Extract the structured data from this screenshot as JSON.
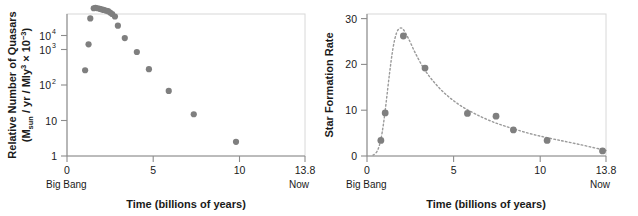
{
  "figure": {
    "panels": [
      {
        "id": "quasars",
        "ylabel_line1": "Relative Number of Quasars",
        "ylabel_line2_a": "(M",
        "ylabel_line2_sub": "sun",
        "ylabel_line2_b": " / yr / Mly",
        "ylabel_line2_sup1": "3",
        "ylabel_line2_c": " × 10",
        "ylabel_line2_sup2": "−3",
        "ylabel_line2_d": ")",
        "xlabel": "Time (billions of years)",
        "x_ticklabels": [
          "0",
          "5",
          "10",
          "13.8"
        ],
        "y_ticklabels": [
          "1",
          "10",
          "10",
          "10",
          "10"
        ],
        "y_tick_sups": [
          "",
          "",
          "2",
          "3",
          "4"
        ],
        "left_endnote": "Big Bang",
        "right_endnote": "Now"
      },
      {
        "id": "star-formation",
        "ylabel_line1": "Star Formation Rate",
        "xlabel": "Time (billions of years)",
        "x_ticklabels": [
          "0",
          "5",
          "10",
          "13.8"
        ],
        "y_ticklabels": [
          "0",
          "10",
          "20",
          "30"
        ],
        "left_endnote": "Big Bang",
        "right_endnote": "Now"
      }
    ]
  },
  "chart_data": [
    {
      "type": "scatter",
      "title": "",
      "xlabel": "Time (billions of years)",
      "ylabel": "Relative Number of Quasars (M_sun / yr / Mly^3 × 10^-3)",
      "xlim": [
        0,
        13.8
      ],
      "ylim": [
        1,
        30000
      ],
      "yscale": "log",
      "xscale": "linear",
      "xticks": [
        0,
        5,
        10,
        13.8
      ],
      "xticklabels": [
        "0",
        "5",
        "10",
        "13.8"
      ],
      "yticks": [
        1,
        10,
        100,
        1000,
        10000
      ],
      "yticklabels": [
        "1",
        "10",
        "10^2",
        "10^3",
        "10^4"
      ],
      "grid": false,
      "legend": null,
      "marker_color": "#7f7f7f",
      "annotations": [
        {
          "text": "Big Bang",
          "x": 0,
          "position": "below-axis-left"
        },
        {
          "text": "Now",
          "x": 13.8,
          "position": "below-axis-right"
        }
      ],
      "x": [
        1.05,
        1.25,
        1.35,
        1.55,
        1.65,
        1.78,
        1.9,
        2.0,
        2.12,
        2.25,
        2.38,
        2.5,
        2.62,
        2.78,
        2.95,
        3.35,
        4.05,
        4.75,
        5.9,
        7.35,
        9.8
      ],
      "y": [
        260,
        1400,
        7500,
        14500,
        15000,
        14500,
        14000,
        13500,
        13000,
        12500,
        12000,
        11000,
        10000,
        8500,
        4700,
        2100,
        850,
        280,
        68,
        15,
        2.5
      ]
    },
    {
      "type": "scatter",
      "title": "",
      "xlabel": "Time (billions of years)",
      "ylabel": "Star Formation Rate",
      "xlim": [
        0,
        13.8
      ],
      "ylim": [
        0,
        31
      ],
      "yscale": "linear",
      "xscale": "linear",
      "xticks": [
        0,
        5,
        10,
        13.8
      ],
      "xticklabels": [
        "0",
        "5",
        "10",
        "13.8"
      ],
      "yticks": [
        0,
        10,
        20,
        30
      ],
      "yticklabels": [
        "0",
        "10",
        "20",
        "30"
      ],
      "grid": false,
      "legend": null,
      "marker_color": "#7f7f7f",
      "fit_curve_style": "dotted",
      "annotations": [
        {
          "text": "Big Bang",
          "x": 0,
          "position": "below-axis-left"
        },
        {
          "text": "Now",
          "x": 13.8,
          "position": "below-axis-right"
        }
      ],
      "x": [
        0.8,
        1.05,
        2.1,
        3.35,
        5.8,
        7.45,
        8.45,
        10.4,
        13.6
      ],
      "y": [
        3.4,
        9.4,
        26.2,
        19.2,
        9.3,
        8.7,
        5.7,
        3.4,
        1.1
      ],
      "fit_x": [
        0.35,
        0.5,
        0.65,
        0.8,
        0.95,
        1.1,
        1.3,
        1.5,
        1.7,
        1.9,
        2.1,
        2.4,
        2.8,
        3.3,
        3.9,
        4.6,
        5.4,
        6.3,
        7.3,
        8.4,
        9.6,
        10.9,
        12.3,
        13.8
      ],
      "fit_y": [
        0.2,
        0.6,
        1.6,
        3.6,
        7.0,
        11.5,
        18.0,
        23.5,
        26.8,
        27.9,
        27.6,
        25.6,
        22.4,
        19.0,
        16.0,
        13.3,
        11.0,
        9.1,
        7.4,
        6.0,
        4.7,
        3.6,
        2.5,
        1.2
      ]
    }
  ]
}
